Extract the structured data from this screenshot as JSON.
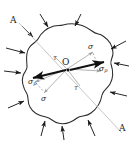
{
  "figure": {
    "type": "stress-analysis-diagram",
    "colors": {
      "outline": "#2b2b2b",
      "load_arrow": "#1a1a1a",
      "section_line": "#b9b9b9",
      "resultant_vector": "#111111",
      "component_line": "#9a9a9a",
      "background": "#ffffff"
    }
  },
  "labels": {
    "section_top": "A",
    "section_bottom": "A",
    "origin": "O",
    "sigma_upper": "σ",
    "sigma_lower": "σ",
    "sigma_p_right": "σ",
    "sigma_p_right_sub": "p",
    "sigma_p_left": "σ",
    "sigma_p_left_sub": "p",
    "tau_upper": "τ",
    "tau_lower": "τ"
  },
  "load_arrows": {
    "count": 12,
    "direction": "inward",
    "note": "External compressive surface loads normal-ish to the boundary"
  },
  "section_plane": {
    "label": "A-A",
    "orientation": "upper-left to lower-right diagonal"
  },
  "stress_components": {
    "resultant": "σ",
    "normal": "σp",
    "shear": "τ"
  }
}
